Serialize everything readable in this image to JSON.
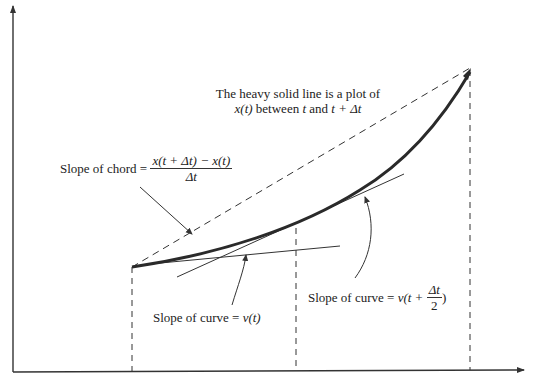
{
  "diagram": {
    "title_line1": "The heavy solid line is a plot of",
    "title_line2_x": "x",
    "title_line2_t": "(t)",
    "title_line2_mid": " between ",
    "title_line2_t2": "t",
    "title_line2_and": " and ",
    "title_line2_end": "t + Δt",
    "chord_label": "Slope of chord =",
    "chord_numerator": "x(t + Δt) − x(t)",
    "chord_denominator": "Δt",
    "curve_label_left_text": "Slope of curve = ",
    "curve_label_left_value": "v(t)",
    "curve_label_right_text": "Slope of curve = ",
    "curve_label_right_prefix": "v(t + ",
    "curve_label_right_num": "Δt",
    "curve_label_right_den": "2",
    "curve_label_right_suffix": ")"
  },
  "colors": {
    "line": "#333333",
    "heavy_curve": "#2a2a2a",
    "background": "#ffffff"
  }
}
